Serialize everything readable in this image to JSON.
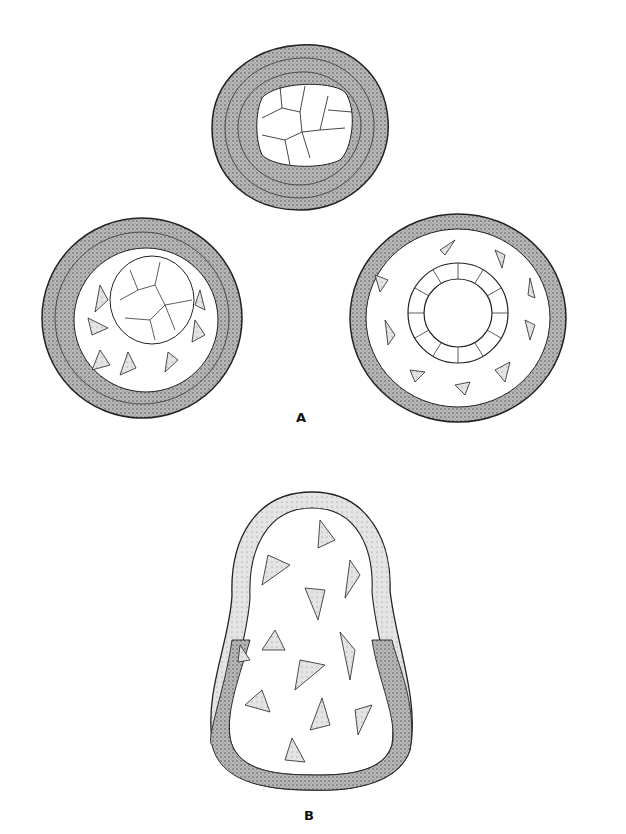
{
  "figure": {
    "panels": [
      {
        "id": "A",
        "label": "A",
        "description": "Three stages: solid cell mass with outer cellular layer; inner mass surrounded by stellate cells; hollow ring of columnar cells surrounded by stellate cells within outer layer"
      },
      {
        "id": "B",
        "label": "B",
        "description": "Oval vesicle with epithelial wall (clear upper, stippled lower) enclosing stellate mesenchymal cells"
      }
    ]
  },
  "colors": {
    "ink": "#222222",
    "stipple": "#9a9a9a",
    "background": "#ffffff"
  }
}
